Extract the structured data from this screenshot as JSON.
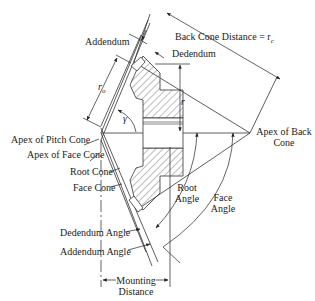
{
  "labels": {
    "addendum": "Addendum",
    "dedendum": "Dedendum",
    "back_cone_distance": "Back Cone Distance = r",
    "back_cone_sub": "c",
    "r_o": "r",
    "r_o_sub": "o",
    "r": "r",
    "gamma": "γ",
    "apex_pitch_cone": "Apex of Pitch Cone",
    "apex_face_cone": "Apex of Face Cone",
    "root_cone": "Root Cone",
    "face_cone": "Face Cone",
    "apex_back_cone_1": "Apex of Back",
    "apex_back_cone_2": "Cone",
    "root_angle_1": "Root",
    "root_angle_2": "Angle",
    "face_angle_1": "Face",
    "face_angle_2": "Angle",
    "dedendum_angle": "Dedendum Angle",
    "addendum_angle": "Addendum Angle",
    "mounting_1": "Mounting",
    "mounting_2": "Distance"
  }
}
